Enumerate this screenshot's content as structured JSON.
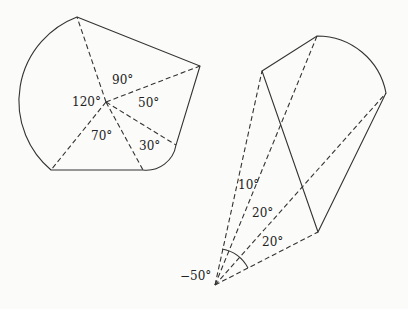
{
  "diagram": {
    "colors": {
      "stroke": "#333333",
      "background": "#fbfbfa"
    },
    "left_figure": {
      "center": [
        106,
        102
      ],
      "angles": [
        {
          "label": "90°",
          "pos": [
            112,
            84
          ]
        },
        {
          "label": "120°",
          "pos": [
            72,
            106
          ]
        },
        {
          "label": "50°",
          "pos": [
            138,
            107
          ]
        },
        {
          "label": "70°",
          "pos": [
            91,
            140
          ]
        },
        {
          "label": "30°",
          "pos": [
            139,
            150
          ]
        }
      ]
    },
    "right_figure": {
      "apex": [
        215,
        285
      ],
      "angles": [
        {
          "label": "10°",
          "pos": [
            238,
            189
          ]
        },
        {
          "label": "20°",
          "pos": [
            252,
            217
          ]
        },
        {
          "label": "20°",
          "pos": [
            262,
            246
          ]
        },
        {
          "label": "−50°",
          "pos": [
            180,
            280
          ]
        }
      ]
    }
  }
}
